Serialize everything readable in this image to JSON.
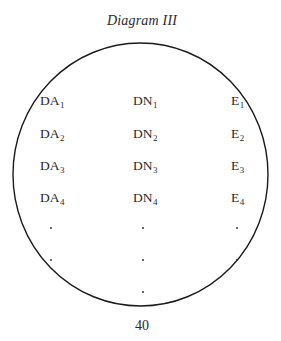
{
  "title": "Diagram III",
  "page_number": "40",
  "circle": {
    "cx": 140.5,
    "cy": 174.5,
    "rx": 127.5,
    "ry": 131.5,
    "stroke": "#1a1a1a"
  },
  "columns": [
    {
      "name": "DA",
      "x": 40,
      "labels": [
        {
          "base": "DA",
          "sub": "1"
        },
        {
          "base": "DA",
          "sub": "2"
        },
        {
          "base": "DA",
          "sub": "3"
        },
        {
          "base": "DA",
          "sub": "4"
        }
      ],
      "ellipsis_dots": 2
    },
    {
      "name": "DN",
      "x": 133,
      "labels": [
        {
          "base": "DN",
          "sub": "1"
        },
        {
          "base": "DN",
          "sub": "2"
        },
        {
          "base": "DN",
          "sub": "3"
        },
        {
          "base": "DN",
          "sub": "4"
        }
      ],
      "ellipsis_dots": 3
    },
    {
      "name": "E",
      "x": 231,
      "labels": [
        {
          "base": "E",
          "sub": "1"
        },
        {
          "base": "E",
          "sub": "2"
        },
        {
          "base": "E",
          "sub": "3"
        },
        {
          "base": "E",
          "sub": "4"
        }
      ],
      "ellipsis_dots": 2
    }
  ]
}
